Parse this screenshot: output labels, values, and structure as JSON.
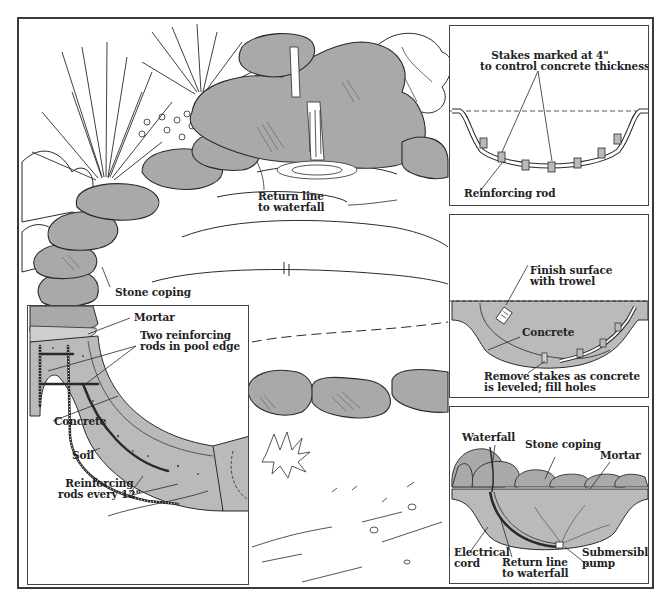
{
  "diagram": {
    "colors": {
      "concrete_fill": "#bababa",
      "rock_fill": "#a9a9a9",
      "line": "#2a2a2a",
      "background": "#ffffff"
    },
    "main_scene": {
      "labels": {
        "return_line": [
          "Return line",
          "to waterfall"
        ],
        "stone_coping": "Stone coping"
      }
    },
    "cross_section_detail": {
      "labels": {
        "mortar": "Mortar",
        "two_rods": [
          "Two reinforcing",
          "rods in pool edge"
        ],
        "concrete": "Concrete",
        "soil": "Soil",
        "reinforcing_rods": [
          "Reinforcing",
          "rods every 12\""
        ]
      }
    },
    "insets": [
      {
        "id": "stakes",
        "labels": {
          "stakes": [
            "Stakes marked at 4\"",
            "to control concrete thickness"
          ],
          "reinforcing_rod": "Reinforcing rod"
        }
      },
      {
        "id": "finish",
        "labels": {
          "finish": [
            "Finish surface",
            "with trowel"
          ],
          "concrete": "Concrete",
          "remove": [
            "Remove stakes as concrete",
            "is leveled; fill holes"
          ]
        }
      },
      {
        "id": "completed",
        "labels": {
          "waterfall": "Waterfall",
          "stone_coping": "Stone coping",
          "mortar": "Mortar",
          "electrical_cord": [
            "Electrical",
            "cord"
          ],
          "return_line": [
            "Return line",
            "to waterfall"
          ],
          "pump": [
            "Submersible",
            "pump"
          ]
        }
      }
    ]
  }
}
